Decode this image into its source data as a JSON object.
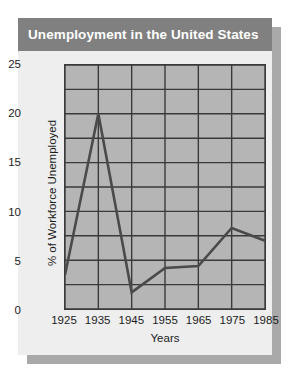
{
  "card": {
    "title": "Unemployment in the United States",
    "title_bar_color": "#808080",
    "title_text_color": "#ffffff",
    "background": "#eeeeee",
    "shadow_color": "#a9a9a9"
  },
  "chart_data": {
    "type": "line",
    "title": "Unemployment in the United States",
    "xlabel": "Years",
    "ylabel": "% of Workforce Unemployed",
    "categories": [
      "1925",
      "1935",
      "1945",
      "1955",
      "1965",
      "1975",
      "1985"
    ],
    "x": [
      1925,
      1935,
      1945,
      1955,
      1965,
      1975,
      1985
    ],
    "values": [
      3.5,
      20.0,
      1.7,
      4.2,
      4.4,
      8.3,
      7.0
    ],
    "series": [
      {
        "name": "% of Workforce Unemployed",
        "values": [
          3.5,
          20.0,
          1.7,
          4.2,
          4.4,
          8.3,
          7.0
        ]
      }
    ],
    "xlim": [
      1925,
      1985
    ],
    "ylim": [
      0,
      25
    ],
    "ytick_labels": [
      "0",
      "5",
      "10",
      "15",
      "20",
      "25"
    ],
    "yticks": [
      0,
      5,
      10,
      15,
      20,
      25
    ],
    "xtick_labels": [
      "1925",
      "1935",
      "1945",
      "1955",
      "1965",
      "1975",
      "1985"
    ],
    "grid": true,
    "grid_h_step": 2.5,
    "grid_v_step": 10,
    "legend": "none",
    "plot_background": "#b5b5b5",
    "line_color": "#4a4a4a",
    "grid_color": "#3a3a3a",
    "axis_color": "#3a3a3a"
  }
}
